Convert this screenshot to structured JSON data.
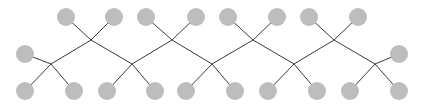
{
  "diagram": {
    "type": "tree-chain",
    "background": "#ffffff",
    "node_color": "#bdbdbd",
    "edge_color": "#3a3a3a",
    "node_radius": 9,
    "junctions": [
      {
        "id": "j1",
        "x": 51,
        "y": 64
      },
      {
        "id": "j2",
        "x": 91,
        "y": 40
      },
      {
        "id": "j3",
        "x": 132,
        "y": 64
      },
      {
        "id": "j4",
        "x": 172,
        "y": 40
      },
      {
        "id": "j5",
        "x": 212,
        "y": 64
      },
      {
        "id": "j6",
        "x": 253,
        "y": 40
      },
      {
        "id": "j7",
        "x": 294,
        "y": 64
      },
      {
        "id": "j8",
        "x": 334,
        "y": 40
      },
      {
        "id": "j9",
        "x": 375,
        "y": 64
      }
    ],
    "nodes": [
      {
        "id": "n-left",
        "x": 25,
        "y": 54,
        "junction": "j1"
      },
      {
        "id": "n-b1",
        "x": 25,
        "y": 91,
        "junction": "j1"
      },
      {
        "id": "n-b2",
        "x": 74,
        "y": 91,
        "junction": "j1"
      },
      {
        "id": "n-t1",
        "x": 66,
        "y": 17,
        "junction": "j2"
      },
      {
        "id": "n-t2",
        "x": 114,
        "y": 17,
        "junction": "j2"
      },
      {
        "id": "n-b3",
        "x": 107,
        "y": 91,
        "junction": "j3"
      },
      {
        "id": "n-b4",
        "x": 155,
        "y": 91,
        "junction": "j3"
      },
      {
        "id": "n-t3",
        "x": 146,
        "y": 17,
        "junction": "j4"
      },
      {
        "id": "n-t4",
        "x": 196,
        "y": 17,
        "junction": "j4"
      },
      {
        "id": "n-b5",
        "x": 186,
        "y": 91,
        "junction": "j5"
      },
      {
        "id": "n-b6",
        "x": 235,
        "y": 91,
        "junction": "j5"
      },
      {
        "id": "n-t5",
        "x": 228,
        "y": 17,
        "junction": "j6"
      },
      {
        "id": "n-t6",
        "x": 277,
        "y": 17,
        "junction": "j6"
      },
      {
        "id": "n-b7",
        "x": 268,
        "y": 91,
        "junction": "j7"
      },
      {
        "id": "n-b8",
        "x": 317,
        "y": 91,
        "junction": "j7"
      },
      {
        "id": "n-t7",
        "x": 309,
        "y": 17,
        "junction": "j8"
      },
      {
        "id": "n-t8",
        "x": 358,
        "y": 17,
        "junction": "j8"
      },
      {
        "id": "n-b9",
        "x": 350,
        "y": 91,
        "junction": "j9"
      },
      {
        "id": "n-b10",
        "x": 399,
        "y": 91,
        "junction": "j9"
      },
      {
        "id": "n-right",
        "x": 399,
        "y": 54,
        "junction": "j9"
      }
    ],
    "chain": [
      "j1",
      "j2",
      "j3",
      "j4",
      "j5",
      "j6",
      "j7",
      "j8",
      "j9"
    ]
  }
}
